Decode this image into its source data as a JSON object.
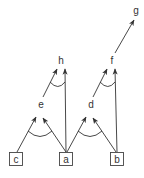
{
  "diagram": {
    "type": "and-or graph",
    "colors": {
      "stroke": "#333333",
      "background": "#ffffff"
    },
    "leaf_nodes": [
      {
        "id": "c",
        "label": "c",
        "x": 15.5,
        "y": 159
      },
      {
        "id": "a",
        "label": "a",
        "x": 66,
        "y": 159
      },
      {
        "id": "b",
        "label": "b",
        "x": 116.5,
        "y": 159
      }
    ],
    "inner_nodes": [
      {
        "id": "e",
        "label": "e",
        "x": 41,
        "y": 104
      },
      {
        "id": "d",
        "label": "d",
        "x": 91,
        "y": 104
      },
      {
        "id": "h",
        "label": "h",
        "x": 61,
        "y": 60
      },
      {
        "id": "f",
        "label": "f",
        "x": 112,
        "y": 60
      },
      {
        "id": "g",
        "label": "g",
        "x": 136,
        "y": 10
      }
    ],
    "edges": [
      {
        "from": "c",
        "to": "e"
      },
      {
        "from": "a",
        "to": "e"
      },
      {
        "from": "a",
        "to": "d"
      },
      {
        "from": "b",
        "to": "d"
      },
      {
        "from": "e",
        "to": "h"
      },
      {
        "from": "a",
        "to": "h"
      },
      {
        "from": "d",
        "to": "f"
      },
      {
        "from": "b",
        "to": "f"
      },
      {
        "from": "f",
        "to": "g"
      }
    ],
    "and_arcs": [
      {
        "target": "e",
        "sources": [
          "c",
          "a"
        ]
      },
      {
        "target": "d",
        "sources": [
          "a",
          "b"
        ]
      },
      {
        "target": "h",
        "sources": [
          "e",
          "a"
        ]
      },
      {
        "target": "f",
        "sources": [
          "d",
          "b"
        ]
      }
    ]
  }
}
